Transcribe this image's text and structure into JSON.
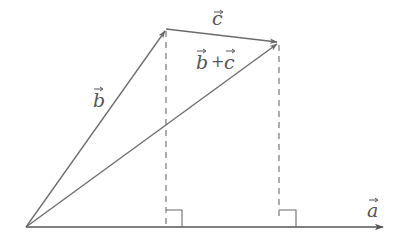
{
  "diagram": {
    "colors": {
      "line": "#6b6b6b",
      "axis": "#555555",
      "label": "#555555",
      "background": "#ffffff"
    },
    "points": {
      "origin": [
        26,
        227
      ],
      "b_tip": [
        166,
        29
      ],
      "c_tip": [
        279,
        42
      ],
      "b_foot": [
        166,
        227
      ],
      "c_foot": [
        279,
        227
      ],
      "axis_end": [
        383,
        227
      ]
    },
    "vectors": [
      {
        "name": "a",
        "label": "a",
        "from": "origin",
        "to": "axis_end"
      },
      {
        "name": "b",
        "label": "b",
        "from": "origin",
        "to": "b_tip"
      },
      {
        "name": "c",
        "label": "c",
        "from": "b_tip",
        "to": "c_tip"
      },
      {
        "name": "b_plus_c",
        "label": "b + c",
        "from": "origin",
        "to": "c_tip"
      }
    ],
    "labels": {
      "a": "a",
      "b": "b",
      "c": "c",
      "sum_b": "b",
      "sum_plus": "+",
      "sum_c": "c"
    },
    "projections": [
      {
        "name": "b-projection",
        "style": "dashed",
        "from": "b_tip",
        "to": "b_foot"
      },
      {
        "name": "c-projection",
        "style": "dashed",
        "from": "c_tip",
        "to": "c_foot"
      }
    ],
    "right_angle_markers": 2
  }
}
